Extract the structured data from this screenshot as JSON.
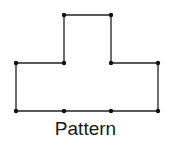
{
  "diagram": {
    "caption": "Pattern",
    "stroke_color": "#222222",
    "point_color": "#111111",
    "outline": [
      [
        16,
        63
      ],
      [
        64,
        63
      ],
      [
        64,
        15
      ],
      [
        111,
        15
      ],
      [
        111,
        63
      ],
      [
        158,
        63
      ],
      [
        158,
        111
      ],
      [
        16,
        111
      ]
    ],
    "points": [
      [
        64,
        15
      ],
      [
        111,
        15
      ],
      [
        16,
        63
      ],
      [
        64,
        63
      ],
      [
        111,
        63
      ],
      [
        158,
        63
      ],
      [
        16,
        111
      ],
      [
        64,
        111
      ],
      [
        111,
        111
      ],
      [
        158,
        111
      ]
    ]
  }
}
